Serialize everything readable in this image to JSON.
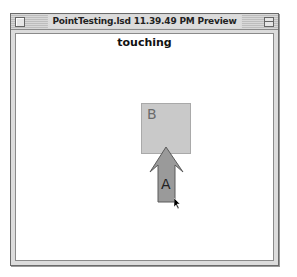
{
  "window": {
    "title": "PointTesting.lsd 11.39.49 PM Preview",
    "close_icon": "close-box",
    "zoom_icon": "zoom-box"
  },
  "stage": {
    "status_text": "touching",
    "sprites": [
      {
        "name": "B",
        "label": "B",
        "shape": "square",
        "color": "#c9c9c9"
      },
      {
        "name": "A",
        "label": "A",
        "shape": "up-arrow",
        "color": "#9a9a9a"
      }
    ],
    "cursor_icon": "arrow-pointer"
  }
}
